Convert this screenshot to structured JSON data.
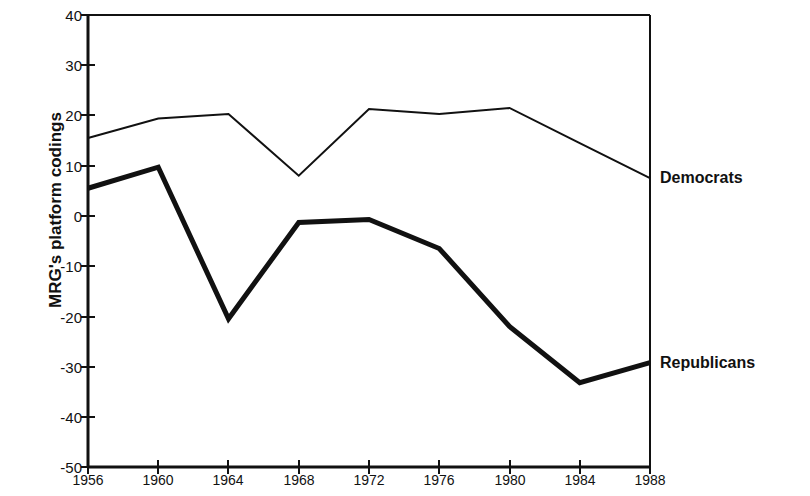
{
  "chart_data": {
    "type": "line",
    "title": "",
    "subtitle": "",
    "xlabel": "",
    "ylabel": "MRG's platform codings",
    "x": [
      1956,
      1960,
      1964,
      1968,
      1972,
      1976,
      1980,
      1984,
      1988
    ],
    "categories": [
      "1956",
      "1960",
      "1964",
      "1968",
      "1972",
      "1976",
      "1980",
      "1984",
      "1988"
    ],
    "xlim": [
      1956,
      1988
    ],
    "ylim": [
      -50,
      40
    ],
    "ytick_labels": [
      "40",
      "30",
      "20",
      "10",
      "0",
      "-10",
      "-20",
      "-30",
      "-40",
      "-50"
    ],
    "yticks": [
      40,
      30,
      20,
      10,
      0,
      -10,
      -20,
      -30,
      -40,
      -50
    ],
    "grid": false,
    "legend_position": "right-inline-annotations",
    "series": [
      {
        "name": "Democrats",
        "values": [
          15.5,
          19.4,
          20.3,
          8.0,
          21.3,
          20.3,
          21.5,
          14.5,
          7.5
        ],
        "color": "#111111",
        "line_width": 2
      },
      {
        "name": "Republicans",
        "values": [
          5.5,
          9.7,
          -20.5,
          -1.3,
          -0.7,
          -6.5,
          -22.0,
          -33.2,
          -29.2
        ],
        "color": "#111111",
        "line_width": 5
      }
    ],
    "annotations": [
      {
        "text": "Democrats",
        "x": 1988,
        "y": 7.5
      },
      {
        "text": "Republicans",
        "x": 1988,
        "y": -29.2
      }
    ]
  }
}
